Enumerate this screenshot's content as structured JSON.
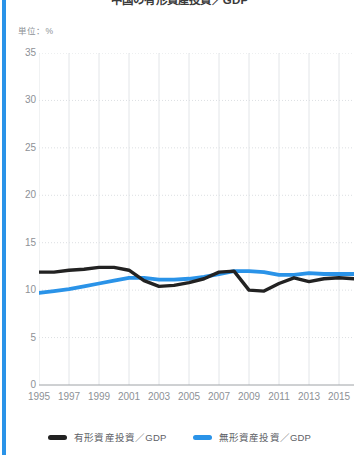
{
  "accent_color": "#2a93e8",
  "title": "中国の有形資産投資／GDP",
  "unit_label": "単位：%",
  "legend": {
    "position": "bottom",
    "items": [
      {
        "label": "有形資産投資／GDP",
        "color": "#222222",
        "swatch_name": "legend-swatch-tangible"
      },
      {
        "label": "無形資産投資／GDP",
        "color": "#2a93e8",
        "swatch_name": "legend-swatch-intangible"
      }
    ]
  },
  "chart_data": {
    "type": "line",
    "title": "中国の有形資産投資／GDP",
    "unit": "%",
    "xlabel": "",
    "ylabel": "単位：%",
    "xlim": [
      1995,
      2016
    ],
    "ylim": [
      0,
      35
    ],
    "yticks": [
      0,
      5,
      10,
      15,
      20,
      25,
      30,
      35
    ],
    "xticks": [
      1995,
      1997,
      1999,
      2001,
      2003,
      2005,
      2007,
      2009,
      2011,
      2013,
      2015
    ],
    "grid": "vertical-and-horizontal-dotted",
    "x": [
      1995,
      1996,
      1997,
      1998,
      1999,
      2000,
      2001,
      2002,
      2003,
      2004,
      2005,
      2006,
      2007,
      2008,
      2009,
      2010,
      2011,
      2012,
      2013,
      2014,
      2015,
      2016
    ],
    "series": [
      {
        "name": "有形資産投資／GDP",
        "color": "#222222",
        "values": [
          11.9,
          11.9,
          12.1,
          12.2,
          12.4,
          12.4,
          12.1,
          11.0,
          10.4,
          10.5,
          10.8,
          11.2,
          11.9,
          12.0,
          10.0,
          9.9,
          10.7,
          11.3,
          10.9,
          11.2,
          11.3,
          11.2
        ]
      },
      {
        "name": "無形資産投資／GDP",
        "color": "#2a93e8",
        "values": [
          9.7,
          9.9,
          10.1,
          10.4,
          10.7,
          11.0,
          11.3,
          11.3,
          11.1,
          11.1,
          11.2,
          11.4,
          11.7,
          12.0,
          12.0,
          11.9,
          11.6,
          11.6,
          11.8,
          11.7,
          11.7,
          11.7
        ]
      }
    ]
  }
}
